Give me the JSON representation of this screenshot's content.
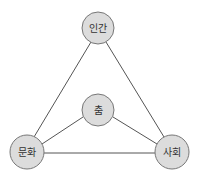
{
  "diagram": {
    "type": "triangle-relationship",
    "colors": {
      "node_fill": "#dcdcdc",
      "node_stroke": "#777777",
      "edge": "#555555",
      "text": "#333333"
    },
    "nodes": [
      {
        "id": "human",
        "label": "인간",
        "cx": 98,
        "cy": 28,
        "r": 16
      },
      {
        "id": "dance",
        "label": "춤",
        "cx": 98,
        "cy": 110,
        "r": 16
      },
      {
        "id": "culture",
        "label": "문화",
        "cx": 27,
        "cy": 152,
        "r": 17
      },
      {
        "id": "society",
        "label": "사회",
        "cx": 172,
        "cy": 152,
        "r": 17
      }
    ],
    "edges": [
      [
        "human",
        "culture"
      ],
      [
        "human",
        "society"
      ],
      [
        "culture",
        "society"
      ],
      [
        "dance",
        "culture"
      ],
      [
        "dance",
        "society"
      ]
    ]
  }
}
